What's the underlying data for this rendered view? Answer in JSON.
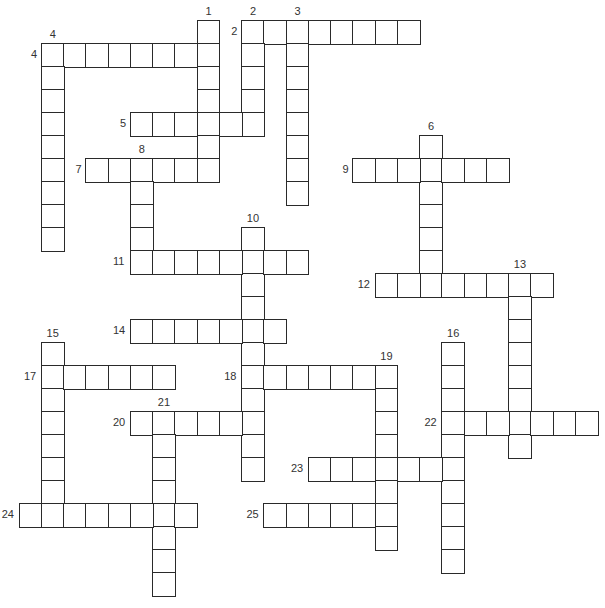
{
  "puzzle": {
    "type": "crossword",
    "layout": {
      "origin_x": 18.7,
      "origin_y": 20,
      "cell_w": 22.25,
      "cell_h": 23
    },
    "colors": {
      "border": "#2a2a2a",
      "cell_bg": "#ffffff",
      "number": "#333333"
    },
    "words": [
      {
        "number": "1",
        "direction": "down",
        "col": 8,
        "row": 0,
        "length": 7
      },
      {
        "number": "2",
        "direction": "across",
        "col": 10,
        "row": 0,
        "length": 8
      },
      {
        "number": "2",
        "direction": "down",
        "col": 10,
        "row": 0,
        "length": 5
      },
      {
        "number": "3",
        "direction": "down",
        "col": 12,
        "row": 0,
        "length": 8
      },
      {
        "number": "4",
        "direction": "across",
        "col": 1,
        "row": 1,
        "length": 8
      },
      {
        "number": "4",
        "direction": "down",
        "col": 1,
        "row": 1,
        "length": 9
      },
      {
        "number": "5",
        "direction": "across",
        "col": 5,
        "row": 4,
        "length": 6
      },
      {
        "number": "6",
        "direction": "down",
        "col": 18,
        "row": 5,
        "length": 7
      },
      {
        "number": "7",
        "direction": "across",
        "col": 3,
        "row": 6,
        "length": 6
      },
      {
        "number": "8",
        "direction": "down",
        "col": 5,
        "row": 6,
        "length": 5
      },
      {
        "number": "9",
        "direction": "across",
        "col": 15,
        "row": 6,
        "length": 7
      },
      {
        "number": "10",
        "direction": "down",
        "col": 10,
        "row": 9,
        "length": 11
      },
      {
        "number": "11",
        "direction": "across",
        "col": 5,
        "row": 10,
        "length": 8
      },
      {
        "number": "12",
        "direction": "across",
        "col": 16,
        "row": 11,
        "length": 8
      },
      {
        "number": "13",
        "direction": "down",
        "col": 22,
        "row": 11,
        "length": 8
      },
      {
        "number": "14",
        "direction": "across",
        "col": 5,
        "row": 13,
        "length": 7
      },
      {
        "number": "15",
        "direction": "down",
        "col": 1,
        "row": 14,
        "length": 8
      },
      {
        "number": "16",
        "direction": "down",
        "col": 19,
        "row": 14,
        "length": 10
      },
      {
        "number": "17",
        "direction": "across",
        "col": 1,
        "row": 15,
        "length": 6
      },
      {
        "number": "18",
        "direction": "across",
        "col": 10,
        "row": 15,
        "length": 7
      },
      {
        "number": "19",
        "direction": "down",
        "col": 16,
        "row": 15,
        "length": 8
      },
      {
        "number": "20",
        "direction": "across",
        "col": 5,
        "row": 17,
        "length": 6
      },
      {
        "number": "21",
        "direction": "down",
        "col": 6,
        "row": 17,
        "length": 8
      },
      {
        "number": "22",
        "direction": "across",
        "col": 19,
        "row": 17,
        "length": 7
      },
      {
        "number": "23",
        "direction": "across",
        "col": 13,
        "row": 19,
        "length": 7
      },
      {
        "number": "24",
        "direction": "across",
        "col": 0,
        "row": 21,
        "length": 8
      },
      {
        "number": "25",
        "direction": "across",
        "col": 11,
        "row": 21,
        "length": 6
      }
    ]
  }
}
